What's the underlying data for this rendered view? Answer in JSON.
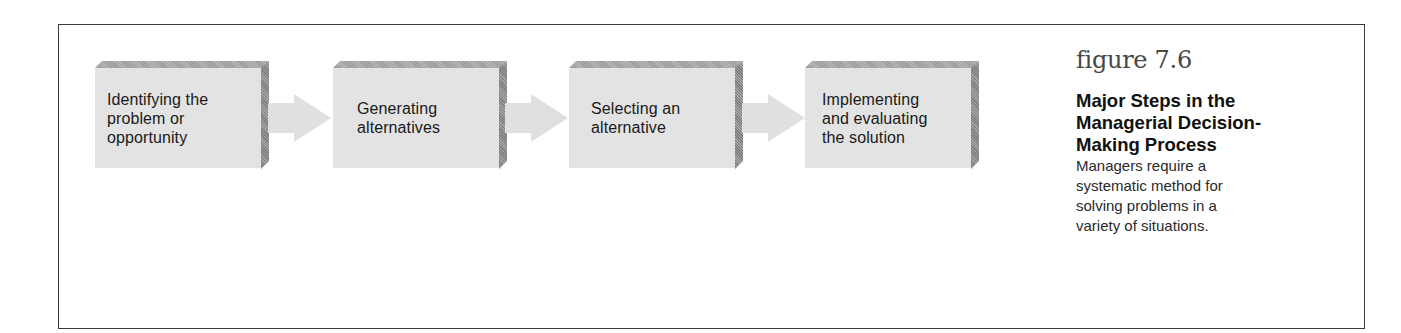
{
  "diagram": {
    "type": "process-flow",
    "steps": [
      {
        "id": 1,
        "lines": [
          "Identifying the",
          "problem or",
          "opportunity"
        ]
      },
      {
        "id": 2,
        "lines": [
          "Generating",
          "alternatives"
        ]
      },
      {
        "id": 3,
        "lines": [
          "Selecting an",
          "alternative"
        ]
      },
      {
        "id": 4,
        "lines": [
          "Implementing",
          "and evaluating",
          "the solution"
        ]
      }
    ],
    "connectors": [
      {
        "from": 1,
        "to": 2,
        "icon": "right-arrow-icon"
      },
      {
        "from": 2,
        "to": 3,
        "icon": "right-arrow-icon"
      },
      {
        "from": 3,
        "to": 4,
        "icon": "right-arrow-icon"
      }
    ],
    "colors": {
      "box_face": "#e3e3e3",
      "box_bevel": "#9a9a9a",
      "arrow": "#e0e0e0",
      "frame_border": "#3a3a3a"
    }
  },
  "caption": {
    "figure_number": "figure 7.6",
    "title_lines": [
      "Major Steps in the",
      "Managerial Decision-",
      "Making Process"
    ],
    "body_lines": [
      "Managers require a",
      "systematic method for",
      "solving problems in a",
      "variety of situations."
    ]
  }
}
